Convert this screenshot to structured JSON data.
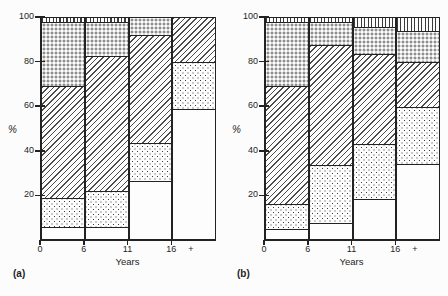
{
  "chart_data": [
    {
      "type": "bar",
      "stacked": true,
      "panel_label": "(a)",
      "xlabel": "Years",
      "ylabel": "%",
      "ylim": [
        0,
        100
      ],
      "grid": false,
      "legend": "none",
      "x_tick_labels": [
        "0",
        "6",
        "11",
        "16",
        "+"
      ],
      "y_tick_labels": [
        "100",
        "80",
        "60",
        "40",
        "20"
      ],
      "categories": [
        "0-6",
        "6-11",
        "11-16",
        "16+"
      ],
      "series": [
        {
          "name": "open (plain fill)",
          "pattern": "plain",
          "values": [
            5,
            5,
            26,
            59
          ]
        },
        {
          "name": "light dot stipple",
          "pattern": "dots",
          "values": [
            13,
            16,
            17,
            21
          ]
        },
        {
          "name": "diagonal hatch",
          "pattern": "diag",
          "values": [
            51,
            62,
            49,
            20
          ]
        },
        {
          "name": "dense grey stipple",
          "pattern": "stipple",
          "values": [
            29,
            15,
            8,
            0
          ]
        },
        {
          "name": "vertical line hatch",
          "pattern": "vlines",
          "values": [
            2,
            2,
            0,
            0
          ]
        }
      ]
    },
    {
      "type": "bar",
      "stacked": true,
      "panel_label": "(b)",
      "xlabel": "Years",
      "ylabel": "%",
      "ylim": [
        0,
        100
      ],
      "grid": false,
      "legend": "none",
      "x_tick_labels": [
        "0",
        "6",
        "11",
        "16",
        "+"
      ],
      "y_tick_labels": [
        "100",
        "80",
        "60",
        "40",
        "20"
      ],
      "categories": [
        "0-6",
        "6-11",
        "11-16",
        "16+"
      ],
      "series": [
        {
          "name": "open (plain fill)",
          "pattern": "plain",
          "values": [
            4,
            7,
            18,
            34
          ]
        },
        {
          "name": "light dot stipple",
          "pattern": "dots",
          "values": [
            11,
            26,
            25,
            26
          ]
        },
        {
          "name": "diagonal hatch",
          "pattern": "diag",
          "values": [
            54,
            55,
            41,
            20
          ]
        },
        {
          "name": "dense grey stipple",
          "pattern": "stipple",
          "values": [
            29,
            10,
            12,
            14
          ]
        },
        {
          "name": "vertical line hatch",
          "pattern": "vlines",
          "values": [
            2,
            2,
            4,
            6
          ]
        }
      ]
    }
  ]
}
